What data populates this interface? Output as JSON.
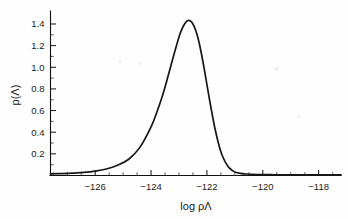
{
  "figure": {
    "background_color": "#fefefe",
    "curve_color": "#171717",
    "axis_color": "#111111"
  },
  "axes": {
    "x_title": "log ρΛ",
    "y_title": "p(Λ)",
    "x_major_ticks": [
      "−126",
      "−124",
      "−122",
      "−120",
      "−118"
    ],
    "y_major_ticks": [
      "0.2",
      "0.4",
      "0.6",
      "0.8",
      "1.0",
      "1.2",
      "1.4"
    ]
  },
  "chart_data": {
    "type": "line",
    "title": "",
    "xlabel": "log ρΛ",
    "ylabel": "p(Λ)",
    "xlim": [
      -127.6,
      -117.2
    ],
    "ylim": [
      0.0,
      1.52
    ],
    "grid": false,
    "legend": null,
    "x_tick_values": [
      -126,
      -124,
      -122,
      -120,
      -118
    ],
    "x_tick_labels": [
      "−126",
      "−124",
      "−122",
      "−120",
      "−118"
    ],
    "x_minor_tick_step": 0.5,
    "y_tick_values": [
      0.2,
      0.4,
      0.6,
      0.8,
      1.0,
      1.2,
      1.4
    ],
    "y_tick_labels": [
      "0.2",
      "0.4",
      "0.6",
      "0.8",
      "1.0",
      "1.2",
      "1.4"
    ],
    "y_minor_tick_step": 0.1,
    "peak": {
      "x": -122.6,
      "y": 1.43
    },
    "series": [
      {
        "name": "p(Λ)",
        "color": "#171717",
        "x": [
          -127.6,
          -127.2,
          -126.8,
          -126.4,
          -126.0,
          -125.6,
          -125.2,
          -124.8,
          -124.4,
          -124.0,
          -123.8,
          -123.6,
          -123.4,
          -123.2,
          -123.0,
          -122.9,
          -122.8,
          -122.7,
          -122.6,
          -122.5,
          -122.4,
          -122.3,
          -122.2,
          -122.1,
          -122.0,
          -121.9,
          -121.8,
          -121.7,
          -121.6,
          -121.5,
          -121.4,
          -121.3,
          -121.2,
          -121.1,
          -121.0,
          -120.8,
          -120.6,
          -120.2,
          -119.6,
          -119.0,
          -118.4,
          -117.8,
          -117.2
        ],
        "y": [
          0.015,
          0.018,
          0.022,
          0.028,
          0.04,
          0.06,
          0.095,
          0.15,
          0.26,
          0.45,
          0.58,
          0.73,
          0.91,
          1.1,
          1.28,
          1.35,
          1.4,
          1.43,
          1.43,
          1.4,
          1.34,
          1.25,
          1.13,
          0.99,
          0.84,
          0.69,
          0.55,
          0.42,
          0.31,
          0.22,
          0.155,
          0.105,
          0.07,
          0.048,
          0.033,
          0.02,
          0.014,
          0.009,
          0.007,
          0.006,
          0.006,
          0.006,
          0.006
        ]
      }
    ]
  }
}
